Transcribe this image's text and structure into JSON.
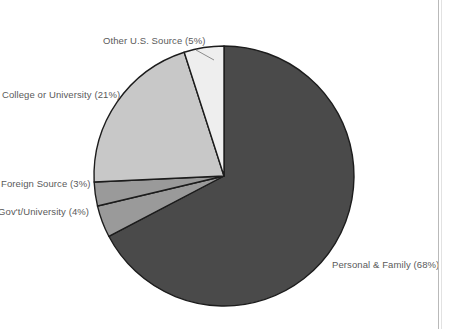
{
  "chart_data": {
    "type": "pie",
    "title": "",
    "legend_position": "none",
    "labels_outside": true,
    "start_angle_deg": 0,
    "direction": "clockwise",
    "categories": [
      "Personal & Family",
      "Foreign Gov't/University",
      "Foreign Source",
      "U.S. College or University",
      "Other U.S. Source"
    ],
    "values": [
      68,
      4,
      3,
      21,
      5
    ],
    "unit": "%",
    "slices": [
      {
        "name": "Personal & Family",
        "label": "Personal & Family (68%)",
        "value": 68,
        "color": "#4a4a4a",
        "clipped": false
      },
      {
        "name": "Foreign Gov't/University",
        "label": "n Gov't/University (4%)",
        "full_label": "Foreign Gov't/University (4%)",
        "value": 4,
        "color": "#9a9a9a",
        "clipped": true
      },
      {
        "name": "Foreign Source",
        "label": "Foreign Source (3%)",
        "value": 3,
        "color": "#9a9a9a",
        "clipped": false
      },
      {
        "name": "U.S. College or University",
        "label": "S. College or University (21%)",
        "full_label": "U.S. College or University (21%)",
        "value": 21,
        "color": "#c8c8c8",
        "clipped": true
      },
      {
        "name": "Other U.S. Source",
        "label": "Other U.S. Source (5%)",
        "value": 5,
        "color": "#eeeeee",
        "clipped": false
      }
    ]
  },
  "colors": {
    "background": "#ffffff",
    "outline": "#1c1c1c",
    "label_text": "#5a5a5a",
    "page_rule": "#b9b9b9"
  }
}
